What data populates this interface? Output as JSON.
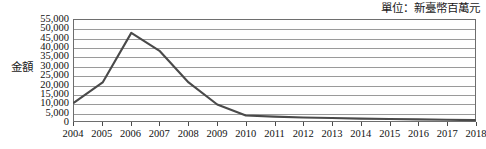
{
  "chart_data": {
    "type": "line",
    "title": "",
    "unit_note": "單位：新臺幣百萬元",
    "xlabel": "",
    "ylabel": "金額",
    "categories": [
      "2004",
      "2005",
      "2006",
      "2007",
      "2008",
      "2009",
      "2010",
      "2011",
      "2012",
      "2013",
      "2014",
      "2015",
      "2016",
      "2017",
      "2018"
    ],
    "values": [
      10000,
      21000,
      48000,
      38000,
      21000,
      9000,
      3000,
      2400,
      1900,
      1600,
      1300,
      1100,
      900,
      700,
      500
    ],
    "series": [
      {
        "name": "金額",
        "values": [
          10000,
          21000,
          48000,
          38000,
          21000,
          9000,
          3000,
          2400,
          1900,
          1600,
          1300,
          1100,
          900,
          700,
          500
        ]
      }
    ],
    "ylim": [
      0,
      55000
    ],
    "ytick_step": 5000,
    "ytick_labels": [
      "55,000",
      "50,000",
      "45,000",
      "40,000",
      "35,000",
      "30,000",
      "25,000",
      "20,000",
      "15,000",
      "10,000",
      "5,000",
      "0"
    ],
    "ytick_values": [
      55000,
      50000,
      45000,
      40000,
      35000,
      30000,
      25000,
      20000,
      15000,
      10000,
      5000,
      0
    ],
    "grid": true,
    "legend": false,
    "legend_position": "none",
    "line_color": "#4a4a4a",
    "grid_color": "#9a9a9a",
    "axis_color": "#6e6e6e"
  }
}
